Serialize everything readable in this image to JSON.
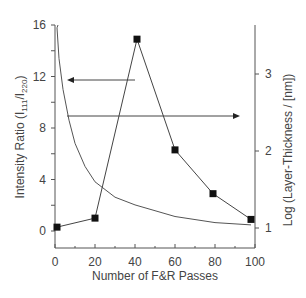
{
  "chart_data": {
    "type": "line",
    "title": "",
    "xlabel": "Number of F&R Passes",
    "ylabel": "Intensity Ratio (I111/I220)",
    "ylabel_main": "Intensity Ratio (I",
    "ylabel_sub1": "111",
    "ylabel_mid": "/I",
    "ylabel_sub2": "220",
    "ylabel_end": ")",
    "y2label": "Log (Layer-Thickness / [nm])",
    "xlim": [
      0,
      100
    ],
    "ylim": [
      -1,
      16
    ],
    "y2lim": [
      0.75,
      3.7
    ],
    "x_ticks": [
      "0",
      "20",
      "40",
      "60",
      "80",
      "100"
    ],
    "y_ticks": [
      "0",
      "4",
      "8",
      "12",
      "16"
    ],
    "y2_ticks": [
      "1",
      "2",
      "3"
    ],
    "grid": false,
    "series": [
      {
        "name": "Intensity Ratio",
        "axis": "left",
        "marker": "square",
        "x": [
          1,
          20,
          41,
          60,
          79,
          98
        ],
        "values": [
          0.3,
          1.0,
          14.9,
          6.3,
          2.9,
          0.9
        ]
      },
      {
        "name": "Log Layer-Thickness",
        "axis": "right",
        "marker": "none",
        "x": [
          1,
          2,
          4,
          7,
          10,
          15,
          20,
          30,
          40,
          60,
          80,
          98
        ],
        "values": [
          3.6,
          3.2,
          2.8,
          2.4,
          2.1,
          1.8,
          1.6,
          1.4,
          1.3,
          1.15,
          1.07,
          1.04
        ]
      }
    ],
    "annotations": [
      {
        "type": "arrow",
        "direction": "left",
        "points_to": "left axis",
        "y": 11.7
      },
      {
        "type": "arrow",
        "direction": "right",
        "points_to": "right axis",
        "y": 9.1
      }
    ]
  }
}
